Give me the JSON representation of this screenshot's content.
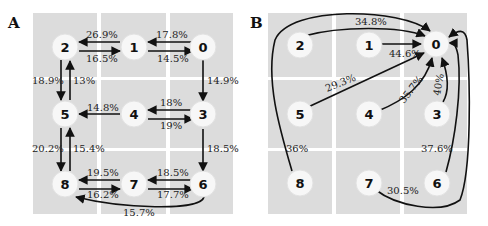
{
  "panels": [
    {
      "id": "A",
      "label": "A",
      "nodes": [
        "0",
        "1",
        "2",
        "3",
        "4",
        "5",
        "6",
        "7",
        "8"
      ],
      "edges": [
        {
          "from": "1",
          "to": "2",
          "label": "26.9%"
        },
        {
          "from": "2",
          "to": "1",
          "label": "16.5%"
        },
        {
          "from": "0",
          "to": "1",
          "label": "17.8%"
        },
        {
          "from": "1",
          "to": "0",
          "label": "14.5%"
        },
        {
          "from": "2",
          "to": "5",
          "label": "18.9%"
        },
        {
          "from": "5",
          "to": "2",
          "label": "13%"
        },
        {
          "from": "0",
          "to": "3",
          "label": "14.9%"
        },
        {
          "from": "4",
          "to": "5",
          "label": "14.8%"
        },
        {
          "from": "3",
          "to": "4",
          "label": "18%"
        },
        {
          "from": "4",
          "to": "3",
          "label": "19%"
        },
        {
          "from": "5",
          "to": "8",
          "label": "20.2%"
        },
        {
          "from": "8",
          "to": "5",
          "label": "15.4%"
        },
        {
          "from": "3",
          "to": "6",
          "label": "18.5%"
        },
        {
          "from": "7",
          "to": "8",
          "label": "19.5%"
        },
        {
          "from": "8",
          "to": "7",
          "label": "16.2%"
        },
        {
          "from": "6",
          "to": "7",
          "label": "18.5%"
        },
        {
          "from": "7",
          "to": "6",
          "label": "17.7%"
        },
        {
          "from": "6",
          "to": "8",
          "label": "15.7%"
        }
      ]
    },
    {
      "id": "B",
      "label": "B",
      "nodes": [
        "0",
        "1",
        "2",
        "3",
        "4",
        "5",
        "6",
        "7",
        "8"
      ],
      "edges": [
        {
          "from": "2",
          "to": "0",
          "label": "34.8%"
        },
        {
          "from": "1",
          "to": "0",
          "label": "44.6%"
        },
        {
          "from": "5",
          "to": "0",
          "label": "29.3%"
        },
        {
          "from": "4",
          "to": "0",
          "label": "35.7%"
        },
        {
          "from": "3",
          "to": "0",
          "label": "40%"
        },
        {
          "from": "8",
          "to": "0",
          "label": "36%"
        },
        {
          "from": "6",
          "to": "0",
          "label": "37.6%"
        },
        {
          "from": "7",
          "to": "0",
          "label": "30.5%"
        }
      ]
    }
  ],
  "A": {
    "label": "A",
    "nodes": {
      "n0": "0",
      "n1": "1",
      "n2": "2",
      "n3": "3",
      "n4": "4",
      "n5": "5",
      "n6": "6",
      "n7": "7",
      "n8": "8"
    },
    "e": {
      "e12": "26.9%",
      "e21": "16.5%",
      "e01": "17.8%",
      "e10": "14.5%",
      "e25": "18.9%",
      "e52": "13%",
      "e03": "14.9%",
      "e45": "14.8%",
      "e34": "18%",
      "e43": "19%",
      "e58": "20.2%",
      "e85": "15.4%",
      "e36": "18.5%",
      "e78": "19.5%",
      "e87": "16.2%",
      "e67": "18.5%",
      "e76": "17.7%",
      "e68": "15.7%"
    }
  },
  "B": {
    "label": "B",
    "nodes": {
      "n0": "0",
      "n1": "1",
      "n2": "2",
      "n3": "3",
      "n4": "4",
      "n5": "5",
      "n6": "6",
      "n7": "7",
      "n8": "8"
    },
    "e": {
      "e20": "34.8%",
      "e10": "44.6%",
      "e50": "29.3%",
      "e40": "35.7%",
      "e30": "40%",
      "e80": "36%",
      "e60": "37.6%",
      "e70": "30.5%"
    }
  }
}
